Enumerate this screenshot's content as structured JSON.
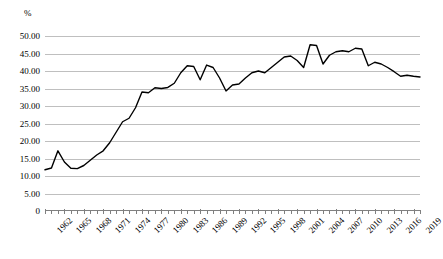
{
  "chart_data": {
    "type": "line",
    "title": "",
    "xlabel": "",
    "ylabel": "%",
    "ylim": [
      0,
      50
    ],
    "ytick_labels": [
      "50.00",
      "45.00",
      "40.00",
      "35.00",
      "30.00",
      "25.00",
      "20.00",
      "15.00",
      "10.00",
      "5.00",
      "0"
    ],
    "ytick_values": [
      50,
      45,
      40,
      35,
      30,
      25,
      20,
      15,
      10,
      5,
      0
    ],
    "xtick_labels": [
      "1962",
      "1965",
      "1968",
      "1971",
      "1974",
      "1977",
      "1980",
      "1983",
      "1986",
      "1989",
      "1992",
      "1995",
      "1998",
      "2001",
      "2004",
      "2007",
      "2010",
      "2013",
      "2016",
      "2019"
    ],
    "grid": true,
    "legend": "none",
    "line_color": "#000000",
    "grid_color": "#bfbfbf",
    "x": [
      1962,
      1963,
      1964,
      1965,
      1966,
      1967,
      1968,
      1969,
      1970,
      1971,
      1972,
      1973,
      1974,
      1975,
      1976,
      1977,
      1978,
      1979,
      1980,
      1981,
      1982,
      1983,
      1984,
      1985,
      1986,
      1987,
      1988,
      1989,
      1990,
      1991,
      1992,
      1993,
      1994,
      1995,
      1996,
      1997,
      1998,
      1999,
      2000,
      2001,
      2002,
      2003,
      2004,
      2005,
      2006,
      2007,
      2008,
      2009,
      2010,
      2011,
      2012,
      2013,
      2014,
      2015,
      2016,
      2017,
      2018,
      2019,
      2020
    ],
    "values": [
      11.8,
      12.3,
      17.2,
      14.0,
      12.2,
      12.1,
      13.0,
      14.5,
      16.0,
      17.2,
      19.5,
      22.5,
      25.5,
      26.5,
      29.5,
      34.0,
      33.8,
      35.2,
      35.0,
      35.3,
      36.5,
      39.5,
      41.5,
      41.3,
      37.5,
      41.7,
      41.0,
      38.0,
      34.3,
      36.0,
      36.3,
      38.0,
      39.5,
      40.0,
      39.5,
      41.0,
      42.5,
      44.0,
      44.3,
      43.0,
      41.0,
      47.5,
      47.3,
      42.0,
      44.5,
      45.5,
      45.8,
      45.5,
      46.5,
      46.3,
      41.5,
      42.5,
      42.0,
      41.0,
      39.8,
      38.5,
      38.8,
      38.5,
      38.3
    ]
  }
}
